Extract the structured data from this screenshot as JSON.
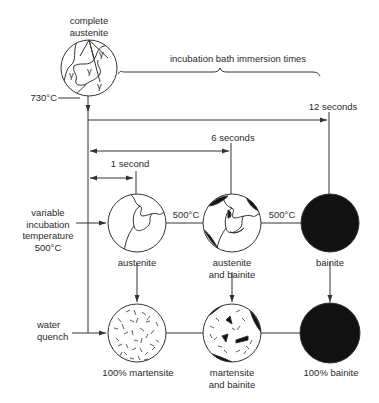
{
  "diagram": {
    "title_node": {
      "line1": "complete",
      "line2": "austenite",
      "grain_symbol": "γ"
    },
    "start_temperature": "730°C",
    "brace_label": "incubation bath immersion times",
    "times": [
      {
        "label": "1 second"
      },
      {
        "label": "6 seconds"
      },
      {
        "label": "12 seconds"
      }
    ],
    "row_labels": {
      "incubation": {
        "line1": "variable",
        "line2": "incubation",
        "line3": "temperature",
        "line4": "500°C"
      },
      "quench": {
        "line1": "water",
        "line2": "quench"
      }
    },
    "bath_temperature_labels": [
      "500°C",
      "500°C"
    ],
    "incubation_nodes": [
      {
        "line1": "austenite",
        "line2": ""
      },
      {
        "line1": "austenite",
        "line2": "and bainite"
      },
      {
        "line1": "bainite",
        "line2": ""
      }
    ],
    "quench_nodes": [
      {
        "line1": "100% martensite",
        "line2": ""
      },
      {
        "line1": "martensite",
        "line2": "and bainite"
      },
      {
        "line1": "100% bainite",
        "line2": ""
      }
    ],
    "colors": {
      "line": "#333333",
      "bainite_fill": "#111111",
      "background": "#ffffff"
    }
  }
}
